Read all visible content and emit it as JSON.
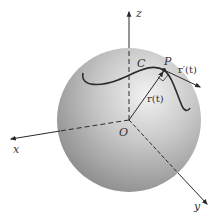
{
  "diagram": {
    "labels": {
      "z": "z",
      "x": "x",
      "y": "y",
      "origin": "O",
      "curve": "C",
      "point": "P",
      "position_vector": "r(t)",
      "tangent_vector": "r′(t)"
    },
    "colors": {
      "sphere_light": "#ececec",
      "sphere_dark": "#8a8a8a",
      "lines": "#2a2a2a"
    }
  }
}
